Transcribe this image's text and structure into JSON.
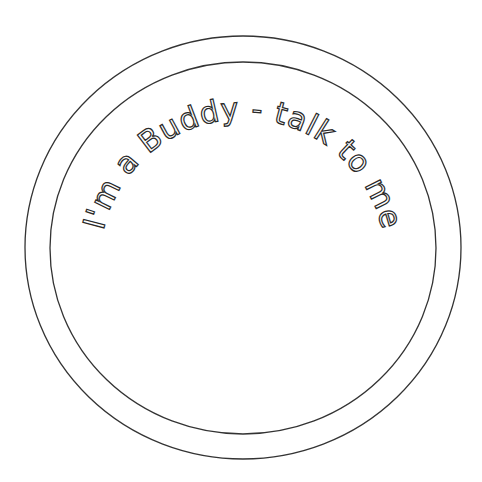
{
  "badge": {
    "text": "I'm a Buddy - talk to me",
    "colors": {
      "background": "#ffffff",
      "outline": "#333333",
      "text_fill": "#ffffff",
      "text_stroke": "#2a2a2a"
    }
  }
}
